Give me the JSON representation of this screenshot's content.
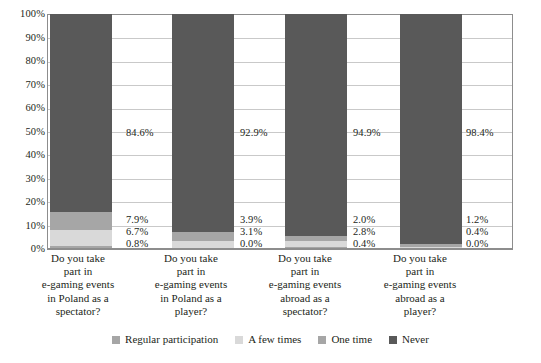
{
  "chart_data": {
    "type": "bar",
    "subtype": "stacked-100-percent",
    "title": "",
    "subtitle": "",
    "xlabel": "",
    "ylabel": "",
    "ylim": [
      0,
      100
    ],
    "grid": true,
    "legend_position": "bottom",
    "categories": [
      "Do you take part in e-gaming events in Poland as a spectator?",
      "Do you take part in e-gaming events in Poland as a player?",
      "Do you take part in e-gaming events abroad as a spectator?",
      "Do you take part in e-gaming events abroad as a player?"
    ],
    "category_lines": [
      [
        "Do you take",
        "part in",
        "e-gaming events",
        "in Poland as a",
        "spectator?"
      ],
      [
        "Do you take",
        "part in",
        "e-gaming events",
        "in Poland as a",
        "player?"
      ],
      [
        "Do you take",
        "part in",
        "e-gaming events",
        "abroad as a",
        "spectator?"
      ],
      [
        "Do you take",
        "part in",
        "e-gaming events",
        "abroad as a",
        "player?"
      ]
    ],
    "series": [
      {
        "name": "Regular participation",
        "color": "#a6a6a6",
        "values": [
          0.8,
          0.0,
          0.4,
          0.0
        ],
        "labels": [
          "0.8%",
          "0.0%",
          "0.4%",
          "0.0%"
        ]
      },
      {
        "name": "A few times",
        "color": "#d9d9d9",
        "values": [
          6.7,
          3.1,
          2.8,
          0.4
        ],
        "labels": [
          "6.7%",
          "3.1%",
          "2.8%",
          "0.4%"
        ]
      },
      {
        "name": "One time",
        "color": "#a6a6a6",
        "values": [
          7.9,
          3.9,
          2.0,
          1.2
        ],
        "labels": [
          "7.9%",
          "3.9%",
          "2.0%",
          "1.2%"
        ]
      },
      {
        "name": "Never",
        "color": "#595959",
        "values": [
          84.6,
          92.9,
          94.9,
          98.4
        ],
        "labels": [
          "84.6%",
          "92.9%",
          "94.9%",
          "98.4%"
        ]
      }
    ],
    "yticks": [
      "100%",
      "90%",
      "80%",
      "70%",
      "60%",
      "50%",
      "40%",
      "30%",
      "20%",
      "10%",
      "0%"
    ],
    "ytick_values": [
      100,
      90,
      80,
      70,
      60,
      50,
      40,
      30,
      20,
      10,
      0
    ]
  },
  "legend": {
    "items": [
      {
        "label": "Regular participation",
        "color": "#a6a6a6"
      },
      {
        "label": "A few times",
        "color": "#d9d9d9"
      },
      {
        "label": "One time",
        "color": "#a6a6a6"
      },
      {
        "label": "Never",
        "color": "#595959"
      }
    ]
  },
  "colors": {
    "plot_border": "#8d8d8d",
    "gridline": "#c9c9c9",
    "text": "#231f20",
    "background": "#ffffff"
  }
}
